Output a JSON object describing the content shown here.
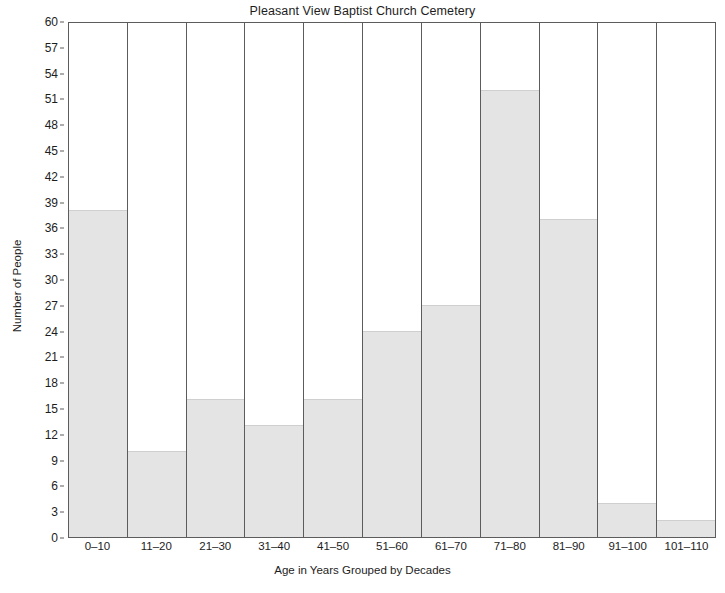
{
  "chart_data": {
    "type": "bar",
    "title": "Pleasant View Baptist Church Cemetery",
    "xlabel": "Age in Years Grouped by Decades",
    "ylabel": "Number of People",
    "categories": [
      "0–10",
      "11–20",
      "21–30",
      "31–40",
      "41–50",
      "51–60",
      "61–70",
      "71–80",
      "81–90",
      "91–100",
      "101–110"
    ],
    "values": [
      38,
      10,
      16,
      13,
      16,
      24,
      27,
      52,
      37,
      4,
      2
    ],
    "ylim": [
      0,
      60
    ],
    "ytick_step": 3,
    "yticks": [
      0,
      3,
      6,
      9,
      12,
      15,
      18,
      21,
      24,
      27,
      30,
      33,
      36,
      39,
      42,
      45,
      48,
      51,
      54,
      57,
      60
    ],
    "ytick_labels": [
      "0",
      "3",
      "6",
      "9",
      "12",
      "15",
      "18",
      "21",
      "24",
      "27",
      "30",
      "33",
      "36",
      "39",
      "42",
      "45",
      "48",
      "51",
      "54",
      "57",
      "60"
    ],
    "grid": false,
    "legend": null,
    "bar_color": "#e4e4e4",
    "bar_edge_color": "#5c5c5c",
    "axis_color": "#5c5c5c",
    "text_color": "#1d1d1d",
    "background_color": "#ffffff"
  }
}
